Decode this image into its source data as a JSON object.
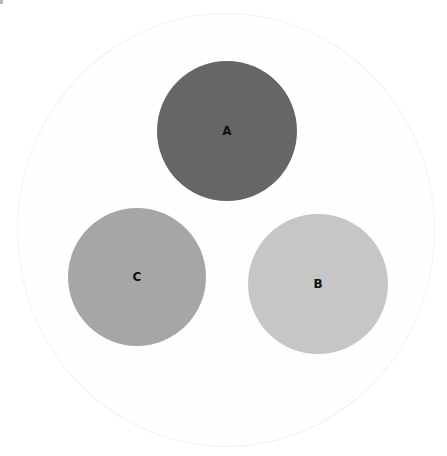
{
  "diagram": {
    "type": "venn-like circles in container",
    "container": {
      "cx": 226,
      "cy": 230,
      "rx": 209,
      "ry": 217,
      "fill": "#fefefe",
      "stroke": "#f2f2f2"
    },
    "circles": [
      {
        "id": "A",
        "label": "A",
        "cx": 227,
        "cy": 131,
        "r": 70,
        "fill": "#666666"
      },
      {
        "id": "C",
        "label": "C",
        "cx": 137,
        "cy": 277,
        "r": 69,
        "fill": "#a6a6a6"
      },
      {
        "id": "B",
        "label": "B",
        "cx": 318,
        "cy": 284,
        "r": 70,
        "fill": "#c6c6c6"
      }
    ]
  }
}
